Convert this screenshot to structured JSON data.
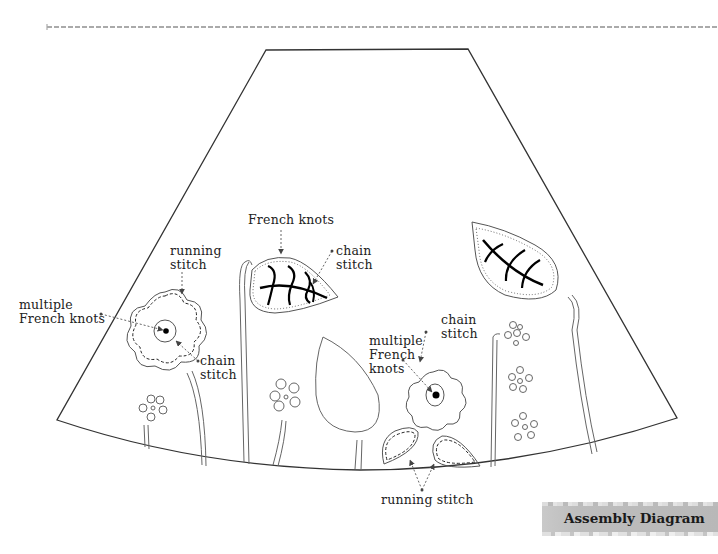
{
  "figure": {
    "caption": "Assembly Diagram",
    "colors": {
      "outline": "#333333",
      "stroke_light": "#777777",
      "caption_bg": "#bcbcbc",
      "text": "#222222",
      "leader": "#666666"
    }
  },
  "labels": {
    "running_stitch_top": "running\nstitch",
    "multiple_french_knots_left": "multiple\nFrench knots",
    "chain_stitch_left": "chain\nstitch",
    "french_knots_leaf": "French knots",
    "chain_stitch_leaf": "chain\nstitch",
    "multiple_french_knots_right": "multiple\nFrench\nknots",
    "chain_stitch_right": "chain\nstitch",
    "running_stitch_bottom": "running stitch"
  }
}
